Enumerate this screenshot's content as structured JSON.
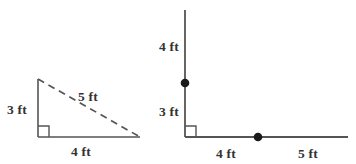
{
  "page": {
    "background_color": "#ffffff",
    "stroke_color": "#555555",
    "text_color": "#333333",
    "dot_color": "#1a1a1a"
  },
  "figures": [
    {
      "id": "left-triangle",
      "name": "right-triangle-3-4-5",
      "description": "Right triangle with solid vertical leg, solid horizontal leg and dashed hypotenuse",
      "right_angle_marker": true,
      "labels": {
        "vertical_leg": "3 ft",
        "hypotenuse": "5 ft",
        "horizontal_leg": "4 ft"
      }
    },
    {
      "id": "right-axes",
      "name": "perpendicular-rays-with-points",
      "description": "Vertical ray and horizontal ray meeting at a right angle with two marked points",
      "right_angle_marker": true,
      "labels": {
        "vertical_upper": "4 ft",
        "vertical_lower": "3 ft",
        "horizontal_left": "4 ft",
        "horizontal_right": "5 ft"
      },
      "points": [
        {
          "name": "point-on-vertical-ray",
          "on": "vertical"
        },
        {
          "name": "point-on-horizontal-ray",
          "on": "horizontal"
        }
      ]
    }
  ]
}
